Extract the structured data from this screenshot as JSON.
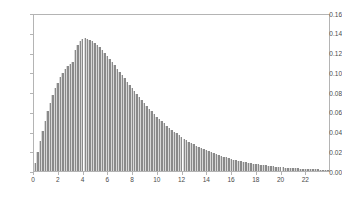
{
  "chart_data": {
    "type": "bar",
    "title": "",
    "subtitle": "",
    "xlabel": "",
    "ylabel": "",
    "xlim": [
      0,
      24
    ],
    "ylim": [
      0,
      0.16
    ],
    "grid": false,
    "legend": null,
    "bar_color": "#8a8a8a",
    "bar_edge_color": "#d8d8d8",
    "axis_color": "#b4b4b4",
    "background_color": "#ffffff",
    "bin_width": 0.2,
    "xticks": [
      0,
      2,
      4,
      6,
      8,
      10,
      12,
      14,
      16,
      18,
      20,
      22
    ],
    "xtick_labels": [
      "0",
      "2",
      "4",
      "6",
      "8",
      "10",
      "12",
      "14",
      "16",
      "18",
      "20",
      "22"
    ],
    "yticks": [
      0.0,
      0.02,
      0.04,
      0.06,
      0.08,
      0.1,
      0.12,
      0.14,
      0.16
    ],
    "ytick_labels": [
      "0.00",
      "0.02",
      "0.04",
      "0.06",
      "0.08",
      "0.10",
      "0.12",
      "0.14",
      "0.16"
    ],
    "x": [
      0.1,
      0.3,
      0.5,
      0.7,
      0.9,
      1.1,
      1.3,
      1.5,
      1.7,
      1.9,
      2.1,
      2.3,
      2.5,
      2.7,
      2.9,
      3.1,
      3.3,
      3.5,
      3.7,
      3.9,
      4.1,
      4.3,
      4.5,
      4.7,
      4.9,
      5.1,
      5.3,
      5.5,
      5.7,
      5.9,
      6.1,
      6.3,
      6.5,
      6.7,
      6.9,
      7.1,
      7.3,
      7.5,
      7.7,
      7.9,
      8.1,
      8.3,
      8.5,
      8.7,
      8.9,
      9.1,
      9.3,
      9.5,
      9.7,
      9.9,
      10.1,
      10.3,
      10.5,
      10.7,
      10.9,
      11.1,
      11.3,
      11.5,
      11.7,
      11.9,
      12.1,
      12.3,
      12.5,
      12.7,
      12.9,
      13.1,
      13.3,
      13.5,
      13.7,
      13.9,
      14.1,
      14.3,
      14.5,
      14.7,
      14.9,
      15.1,
      15.3,
      15.5,
      15.7,
      15.9,
      16.1,
      16.3,
      16.5,
      16.7,
      16.9,
      17.1,
      17.3,
      17.5,
      17.7,
      17.9,
      18.1,
      18.3,
      18.5,
      18.7,
      18.9,
      19.1,
      19.3,
      19.5,
      19.7,
      19.9,
      20.1,
      20.3,
      20.5,
      20.7,
      20.9,
      21.1,
      21.3,
      21.5,
      21.7,
      21.9,
      22.1,
      22.3,
      22.5,
      22.7,
      22.9,
      23.1,
      23.3,
      23.5,
      23.7,
      23.9
    ],
    "values": [
      0.0077,
      0.019,
      0.0302,
      0.041,
      0.0511,
      0.0605,
      0.069,
      0.0767,
      0.0836,
      0.0896,
      0.0948,
      0.0993,
      0.1031,
      0.1062,
      0.1087,
      0.1107,
      0.1221,
      0.1281,
      0.1318,
      0.134,
      0.1344,
      0.134,
      0.133,
      0.1316,
      0.1298,
      0.1276,
      0.1252,
      0.1225,
      0.1197,
      0.1167,
      0.1136,
      0.1104,
      0.1071,
      0.1038,
      0.1005,
      0.0971,
      0.0938,
      0.0904,
      0.0871,
      0.0839,
      0.0807,
      0.0775,
      0.0745,
      0.0715,
      0.0686,
      0.0657,
      0.063,
      0.0603,
      0.0577,
      0.0552,
      0.0528,
      0.0504,
      0.0482,
      0.046,
      0.0439,
      0.0419,
      0.0399,
      0.0381,
      0.0363,
      0.0346,
      0.0329,
      0.0313,
      0.0298,
      0.0284,
      0.027,
      0.0256,
      0.0244,
      0.0232,
      0.022,
      0.0209,
      0.0198,
      0.0188,
      0.0179,
      0.0169,
      0.0161,
      0.0152,
      0.0144,
      0.0137,
      0.013,
      0.0123,
      0.0116,
      0.011,
      0.0104,
      0.0099,
      0.0093,
      0.0088,
      0.0083,
      0.0079,
      0.0075,
      0.0071,
      0.0067,
      0.0063,
      0.006,
      0.0056,
      0.0053,
      0.005,
      0.0047,
      0.0045,
      0.0042,
      0.004,
      0.0037,
      0.0035,
      0.0033,
      0.0031,
      0.003,
      0.0028,
      0.0026,
      0.0025,
      0.0023,
      0.0022,
      0.0021,
      0.0019,
      0.0018,
      0.0017,
      0.0016,
      0.0015,
      0.0014,
      0.0014,
      0.0013,
      0.0012
    ]
  }
}
